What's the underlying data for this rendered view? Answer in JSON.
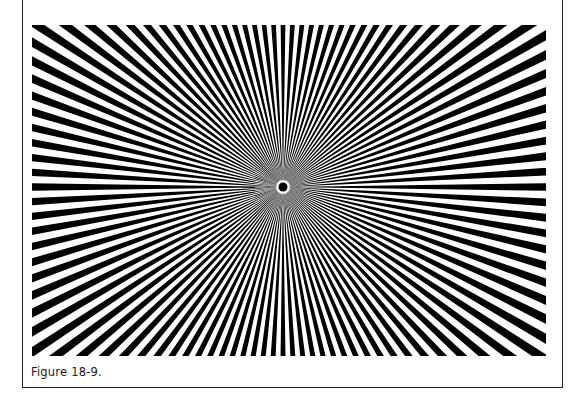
{
  "figure": {
    "caption": "Figure 18-9.",
    "starburst": {
      "spoke_count": 108,
      "spoke_color": "#000000",
      "background_color": "#ffffff",
      "center_dot_color": "#000000",
      "center_ring_color": "#ffffff"
    }
  }
}
